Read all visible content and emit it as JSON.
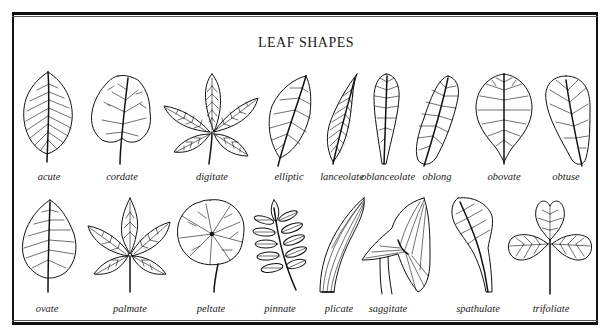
{
  "title": "LEAF SHAPES",
  "rows": [
    {
      "leaves": [
        {
          "name": "acute",
          "label": "acute"
        },
        {
          "name": "cordate",
          "label": "cordate"
        },
        {
          "name": "digitate",
          "label": "digitate"
        },
        {
          "name": "elliptic",
          "label": "elliptic"
        },
        {
          "name": "lanceolate",
          "label": "lanceolate"
        },
        {
          "name": "oblanceolate",
          "label": "oblanceolate"
        },
        {
          "name": "oblong",
          "label": "oblong"
        },
        {
          "name": "obovate",
          "label": "obovate"
        },
        {
          "name": "obtuse",
          "label": "obtuse"
        }
      ]
    },
    {
      "leaves": [
        {
          "name": "ovate",
          "label": "ovate"
        },
        {
          "name": "palmate",
          "label": "palmate"
        },
        {
          "name": "peltate",
          "label": "peltate"
        },
        {
          "name": "pinnate",
          "label": "pinnate"
        },
        {
          "name": "plicate",
          "label": "plicate"
        },
        {
          "name": "saggitate",
          "label": "saggitate"
        },
        {
          "name": "spathulate",
          "label": "spathulate"
        },
        {
          "name": "trifoliate",
          "label": "trifoliate"
        }
      ]
    }
  ]
}
